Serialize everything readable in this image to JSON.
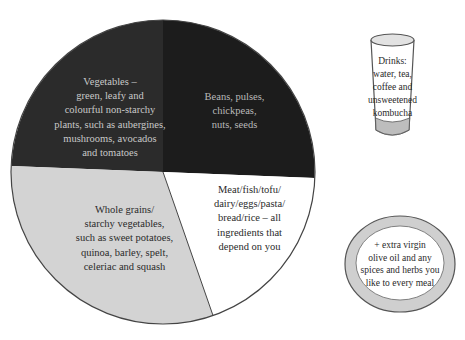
{
  "diagram": {
    "type": "plate-guide",
    "plate_sections": [
      {
        "id": "vegetables",
        "label_lines": [
          "Vegetables –",
          "green, leafy and",
          "colourful non-starchy",
          "plants, such as aubergines,",
          "mushrooms, avocados",
          "and tomatoes"
        ],
        "fill": "#2b2b2b",
        "text_color": "#c9c9c9",
        "approx_share": 25
      },
      {
        "id": "beans",
        "label_lines": [
          "Beans, pulses,",
          "chickpeas,",
          "nuts, seeds"
        ],
        "fill": "#1c1c1c",
        "text_color": "#b9b9b9",
        "approx_share": 25
      },
      {
        "id": "whole-grains",
        "label_lines": [
          "Whole grains/",
          "starchy vegetables,",
          "such as sweet potatoes,",
          "quinoa, barley, spelt,",
          "celeriac and squash"
        ],
        "fill": "#d3d3d3",
        "text_color": "#2a2a2a",
        "approx_share": 29
      },
      {
        "id": "protein",
        "label_lines": [
          "Meat/fish/tofu/",
          "dairy/eggs/pasta/",
          "bread/rice – all",
          "ingredients that",
          "depend on you"
        ],
        "fill": "#ffffff",
        "text_color": "#2a2a2a",
        "approx_share": 21
      }
    ],
    "drinks": {
      "label_lines": [
        "Drinks:",
        "water, tea,",
        "coffee and",
        "unsweetened",
        "kombucha"
      ]
    },
    "side_plate": {
      "label_lines": [
        "+ extra virgin",
        "olive oil and any",
        "spices and herbs you",
        "like to every meal"
      ]
    }
  },
  "colors": {
    "outline": "#444444",
    "glass_base": "#bdbdbd",
    "glass_top": "#e2e2e2",
    "side_ring": "#cfcfcf"
  }
}
